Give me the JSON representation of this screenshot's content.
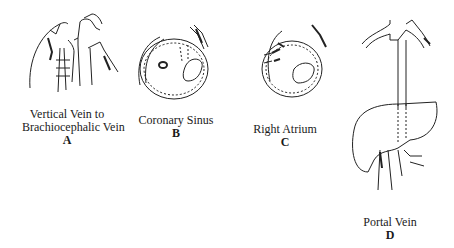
{
  "panels": [
    {
      "id": "A",
      "caption_lines": [
        "Vertical Vein to",
        "Brachiocephalic Vein"
      ],
      "letter": "A"
    },
    {
      "id": "B",
      "caption_lines": [
        "Coronary Sinus"
      ],
      "letter": "B"
    },
    {
      "id": "C",
      "caption_lines": [
        "Right Atrium"
      ],
      "letter": "C"
    },
    {
      "id": "D",
      "caption_lines": [
        "Portal Vein"
      ],
      "letter": "D"
    }
  ]
}
